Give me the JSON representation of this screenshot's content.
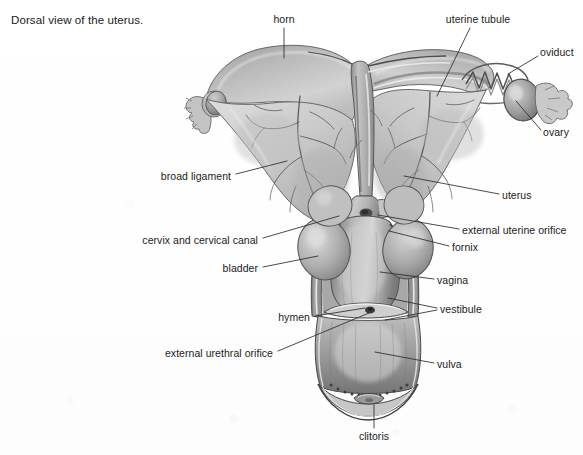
{
  "figure": {
    "caption": "Dorsal view of the uterus.",
    "medium": "grayscale graphite anatomical drawing",
    "background_color": "#fefefe",
    "ink_color": "#1b1b1b",
    "leader_line_color": "#2b2b2b"
  },
  "labels": [
    {
      "id": "horn",
      "text": "horn",
      "align": "center",
      "x": 284,
      "y": 20,
      "leader": [
        [
          284,
          28
        ],
        [
          284,
          58
        ]
      ]
    },
    {
      "id": "uterine-tubule",
      "text": "uterine tubule",
      "align": "center",
      "x": 478,
      "y": 20,
      "leader": [
        [
          470,
          28
        ],
        [
          437,
          96
        ]
      ]
    },
    {
      "id": "oviduct",
      "text": "oviduct",
      "align": "left",
      "x": 540,
      "y": 53,
      "leader": [
        [
          538,
          56
        ],
        [
          508,
          74
        ]
      ]
    },
    {
      "id": "ovary",
      "text": "ovary",
      "align": "left",
      "x": 543,
      "y": 133,
      "leader": [
        [
          541,
          130
        ],
        [
          516,
          101
        ]
      ]
    },
    {
      "id": "broad-ligament",
      "text": "broad ligament",
      "align": "right",
      "x": 231,
      "y": 177,
      "leader": [
        [
          236,
          174
        ],
        [
          287,
          161
        ]
      ]
    },
    {
      "id": "uterus",
      "text": "uterus",
      "align": "left",
      "x": 502,
      "y": 196,
      "leader": [
        [
          499,
          194
        ],
        [
          404,
          176
        ]
      ]
    },
    {
      "id": "cervix-and-cervical-canal",
      "text": "cervix and cervical canal",
      "align": "right",
      "x": 258,
      "y": 241,
      "leader": [
        [
          263,
          238
        ],
        [
          339,
          216
        ]
      ]
    },
    {
      "id": "external-uterine-orifice",
      "text": "external uterine orifice",
      "align": "left",
      "x": 462,
      "y": 231,
      "leader": [
        [
          459,
          229
        ],
        [
          378,
          215
        ]
      ]
    },
    {
      "id": "fornix",
      "text": "fornix",
      "align": "left",
      "x": 452,
      "y": 248,
      "leader": [
        [
          449,
          246
        ],
        [
          389,
          231
        ]
      ]
    },
    {
      "id": "bladder",
      "text": "bladder",
      "align": "right",
      "x": 258,
      "y": 269,
      "leader": [
        [
          263,
          267
        ],
        [
          318,
          256
        ]
      ]
    },
    {
      "id": "vagina",
      "text": "vagina",
      "align": "left",
      "x": 437,
      "y": 281,
      "leader": [
        [
          434,
          279
        ],
        [
          380,
          272
        ]
      ]
    },
    {
      "id": "hymen",
      "text": "hymen",
      "align": "right",
      "x": 310,
      "y": 318,
      "leader": [
        [
          315,
          316
        ],
        [
          365,
          308
        ]
      ]
    },
    {
      "id": "vestibule",
      "text": "vestibule",
      "align": "left",
      "x": 440,
      "y": 310,
      "leader": [
        [
          437,
          308
        ],
        [
          388,
          298
        ]
      ],
      "leader2": [
        [
          437,
          310
        ],
        [
          385,
          320
        ]
      ]
    },
    {
      "id": "external-urethral-orifice",
      "text": "external urethral orifice",
      "align": "right",
      "x": 273,
      "y": 354,
      "leader": [
        [
          278,
          351
        ],
        [
          369,
          313
        ]
      ]
    },
    {
      "id": "vulva",
      "text": "vulva",
      "align": "left",
      "x": 437,
      "y": 365,
      "leader": [
        [
          434,
          363
        ],
        [
          375,
          352
        ]
      ]
    },
    {
      "id": "clitoris",
      "text": "clitoris",
      "align": "center",
      "x": 374,
      "y": 437,
      "leader": [
        [
          374,
          428
        ],
        [
          374,
          405
        ]
      ]
    }
  ]
}
